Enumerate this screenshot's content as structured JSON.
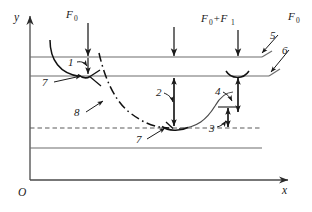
{
  "figure": {
    "kind": "engineering-mechanics-diagram",
    "background_color": "#ffffff",
    "line_color": "#3a3a3a",
    "curve_color": "#111111",
    "text_color": "#1a1a1a"
  },
  "axes": {
    "y_label": "y",
    "x_label": "x",
    "origin_label": "O",
    "y_axis": {
      "x": 30,
      "top": 14,
      "bottom": 180
    },
    "x_axis": {
      "y": 180,
      "left": 30,
      "right": 290
    }
  },
  "horizontal_lines": [
    {
      "name": "upper-boundary-line",
      "y": 57,
      "x_start": 30,
      "x_end": 262,
      "style": "solid"
    },
    {
      "name": "lower-boundary-line",
      "y": 76,
      "x_start": 30,
      "x_end": 268,
      "style": "solid"
    },
    {
      "name": "reference-dashed-line",
      "y": 128,
      "x_start": 30,
      "x_end": 262,
      "style": "dashed"
    },
    {
      "name": "base-solid-line",
      "y": 148,
      "x_start": 30,
      "x_end": 262,
      "style": "solid"
    }
  ],
  "forces": [
    {
      "name": "force-f0-left",
      "label": "F",
      "subscript": "0",
      "x": 88,
      "arrow_from_y": 22,
      "arrow_to_y": 57
    },
    {
      "name": "force-f0-plus-f1",
      "label": "F",
      "subscript": "0",
      "label2": "+F",
      "subscript2": "1",
      "x": 238,
      "arrow_from_y": 26,
      "arrow_to_y": 57
    },
    {
      "name": "force-middle-down",
      "x": 174,
      "arrow_from_y": 26,
      "arrow_to_y": 57
    },
    {
      "name": "force-f0-right",
      "label": "F",
      "subscript": "0",
      "x": 292,
      "y": 20
    }
  ],
  "callouts": [
    {
      "name": "callout-1",
      "label": "1",
      "text_x": 72,
      "text_y": 64,
      "leader_to_x": 88,
      "leader_to_y": 67
    },
    {
      "name": "callout-2",
      "label": "2",
      "text_x": 160,
      "text_y": 96,
      "leader_to_x": 174,
      "leader_to_y": 104
    },
    {
      "name": "callout-3",
      "label": "3",
      "text_x": 213,
      "text_y": 130,
      "leader_to_x": 227,
      "leader_to_y": 122
    },
    {
      "name": "callout-4",
      "label": "4",
      "text_x": 219,
      "text_y": 94,
      "leader_to_x": 232,
      "leader_to_y": 104
    },
    {
      "name": "callout-5",
      "label": "5",
      "text_x": 281,
      "text_y": 36,
      "leader_to_x": 262,
      "leader_to_y": 55
    },
    {
      "name": "callout-6",
      "label": "6",
      "text_x": 292,
      "text_y": 50,
      "leader_to_x": 270,
      "leader_to_y": 76
    },
    {
      "name": "callout-7-left",
      "label": "7",
      "text_x": 45,
      "text_y": 84,
      "leader_to_x": 78,
      "leader_to_y": 76
    },
    {
      "name": "callout-7-right",
      "label": "7",
      "text_x": 139,
      "text_y": 141,
      "leader_to_x": 160,
      "leader_to_y": 128
    },
    {
      "name": "callout-8",
      "label": "8",
      "text_x": 78,
      "text_y": 115,
      "leader_to_x": 100,
      "leader_to_y": 100
    }
  ],
  "curves": [
    {
      "name": "transition-curve-dashdot",
      "style": "dash-dot",
      "path": "M 101,54 C 104,74 112,98 128,112 C 142,124 155,128 170,128"
    },
    {
      "name": "left-hook-curve",
      "style": "solid",
      "path": "M 50,41 C 50,62 62,76 80,76"
    },
    {
      "name": "right-riser-curve",
      "style": "solid",
      "path": "M 178,128 C 196,128 206,118 214,104 C 219,96 224,92 232,92"
    }
  ],
  "meniscus_marks": [
    {
      "name": "meniscus-left-node",
      "cx": 88,
      "cy": 76
    },
    {
      "name": "meniscus-mid-node",
      "cx": 174,
      "cy": 128
    },
    {
      "name": "meniscus-right-node",
      "cx": 238,
      "cy": 76
    }
  ]
}
